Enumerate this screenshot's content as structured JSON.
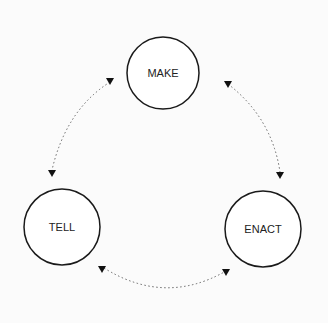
{
  "diagram": {
    "type": "cycle",
    "nodes": [
      {
        "id": "make",
        "label": "MAKE"
      },
      {
        "id": "enact",
        "label": "ENACT"
      },
      {
        "id": "tell",
        "label": "TELL"
      }
    ],
    "edges": [
      {
        "from": "make",
        "to": "enact",
        "style": "dotted",
        "direction": "bidirectional"
      },
      {
        "from": "enact",
        "to": "tell",
        "style": "dotted",
        "direction": "bidirectional"
      },
      {
        "from": "tell",
        "to": "make",
        "style": "dotted",
        "direction": "bidirectional"
      }
    ],
    "colors": {
      "stroke": "#1a1a1a",
      "arrow": "#111111",
      "dots": "#666666",
      "background": "#fbfbfb"
    }
  }
}
